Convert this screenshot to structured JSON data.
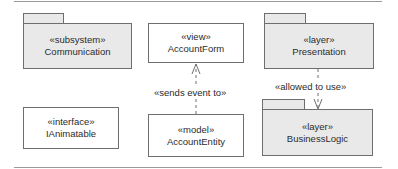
{
  "diagram": {
    "elements": [
      {
        "id": "communication",
        "kind": "package",
        "stereotype": "«subsystem»",
        "name": "Communication"
      },
      {
        "id": "account-form",
        "kind": "class",
        "stereotype": "«view»",
        "name": "AccountForm"
      },
      {
        "id": "presentation",
        "kind": "package",
        "stereotype": "«layer»",
        "name": "Presentation"
      },
      {
        "id": "ianimatable",
        "kind": "class",
        "stereotype": "«interface»",
        "name": "IAnimatable"
      },
      {
        "id": "account-entity",
        "kind": "class",
        "stereotype": "«model»",
        "name": "AccountEntity"
      },
      {
        "id": "business-logic",
        "kind": "package",
        "stereotype": "«layer»",
        "name": "BusinessLogic"
      }
    ],
    "relations": [
      {
        "from": "account-entity",
        "to": "account-form",
        "type": "dependency",
        "label": "«sends event to»"
      },
      {
        "from": "presentation",
        "to": "business-logic",
        "type": "dependency",
        "label": "«allowed to use»"
      }
    ]
  },
  "colors": {
    "package_fill": "#e9e9e9",
    "class_fill": "#ffffff",
    "line": "#6e6e6e",
    "rule": "#9a9a9a"
  }
}
